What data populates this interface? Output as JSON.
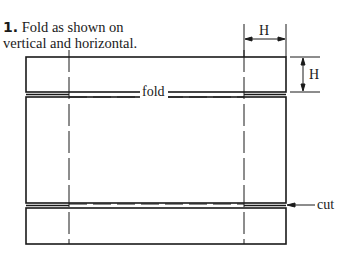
{
  "caption": {
    "step_number": "1.",
    "line1": " Fold as shown on",
    "line2": "vertical and horizontal."
  },
  "labels": {
    "fold": "fold",
    "cut": "cut",
    "width_dimension": "H",
    "height_dimension": "H"
  },
  "colors": {
    "line": "#1a1a1a",
    "background": "#ffffff"
  }
}
